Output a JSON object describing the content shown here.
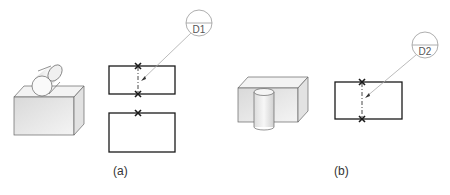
{
  "figures": [
    {
      "id": "a",
      "caption": "(a)",
      "iso_view": {
        "description": "horizontal cylinder resting on top of rectangular block"
      },
      "ortho_view": {
        "boxes": [
          {
            "x": 109,
            "y": 66,
            "w": 66,
            "h": 28
          },
          {
            "x": 109,
            "y": 113,
            "w": 66,
            "h": 39
          }
        ],
        "x_marks": [
          {
            "x": 138,
            "y": 66
          },
          {
            "x": 138,
            "y": 94
          },
          {
            "x": 138,
            "y": 113
          }
        ]
      },
      "balloon": {
        "label": "D1",
        "cx": 199,
        "cy": 23,
        "r": 13,
        "leader_to": {
          "x": 141,
          "y": 80
        }
      }
    },
    {
      "id": "b",
      "caption": "(b)",
      "iso_view": {
        "description": "vertical cylinder standing in front of rectangular block"
      },
      "ortho_view": {
        "boxes": [
          {
            "x": 335,
            "y": 82,
            "w": 67,
            "h": 37
          }
        ],
        "x_marks": [
          {
            "x": 362,
            "y": 82
          },
          {
            "x": 362,
            "y": 119
          }
        ]
      },
      "balloon": {
        "label": "D2",
        "cx": 425,
        "cy": 45,
        "r": 13,
        "leader_to": {
          "x": 365,
          "y": 97
        }
      }
    }
  ],
  "colors": {
    "outline": "#1a1a1a",
    "thin_outline": "#555555",
    "leader": "#aaaaaa",
    "balloon": "#999999",
    "face_front": "#e6e6e6",
    "face_top": "#f2f2f2",
    "face_side": "#d8d8d8"
  }
}
